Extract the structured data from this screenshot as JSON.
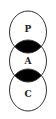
{
  "diagram": {
    "type": "stacked-overlapping-circles",
    "nodes": [
      {
        "label": "P",
        "cx": 28,
        "cy": 32
      },
      {
        "label": "A",
        "cx": 28,
        "cy": 61
      },
      {
        "label": "C",
        "cx": 28,
        "cy": 90
      }
    ],
    "overlap_fill": "#000000",
    "stroke_color": "#333333",
    "background": "#ffffff"
  }
}
